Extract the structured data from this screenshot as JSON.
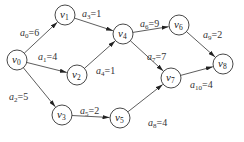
{
  "diagram": {
    "type": "AOE activity network (directed weighted graph)",
    "nodes": [
      {
        "id": "v0",
        "letter": "v",
        "sub": "0",
        "x": 17,
        "y": 60
      },
      {
        "id": "v1",
        "letter": "v",
        "sub": "1",
        "x": 65,
        "y": 15
      },
      {
        "id": "v2",
        "letter": "v",
        "sub": "2",
        "x": 77,
        "y": 75
      },
      {
        "id": "v3",
        "letter": "v",
        "sub": "3",
        "x": 62,
        "y": 115
      },
      {
        "id": "v4",
        "letter": "v",
        "sub": "4",
        "x": 123,
        "y": 34
      },
      {
        "id": "v5",
        "letter": "v",
        "sub": "5",
        "x": 120,
        "y": 118
      },
      {
        "id": "v6",
        "letter": "v",
        "sub": "6",
        "x": 179,
        "y": 25
      },
      {
        "id": "v7",
        "letter": "v",
        "sub": "7",
        "x": 171,
        "y": 78
      },
      {
        "id": "v8",
        "letter": "v",
        "sub": "8",
        "x": 223,
        "y": 64
      }
    ],
    "edges": [
      {
        "id": "a0",
        "from": "v0",
        "to": "v1",
        "letter": "a",
        "sub": "0",
        "weight": "=6",
        "lx": 20,
        "ly": 36
      },
      {
        "id": "a1",
        "from": "v0",
        "to": "v2",
        "letter": "a",
        "sub": "1",
        "weight": "=4",
        "lx": 38,
        "ly": 60
      },
      {
        "id": "a2",
        "from": "v0",
        "to": "v3",
        "letter": "a",
        "sub": "2",
        "weight": "=5",
        "lx": 9,
        "ly": 100
      },
      {
        "id": "a3",
        "from": "v1",
        "to": "v4",
        "letter": "a",
        "sub": "3",
        "weight": "=1",
        "lx": 82,
        "ly": 17
      },
      {
        "id": "a4",
        "from": "v2",
        "to": "v4",
        "letter": "a",
        "sub": "4",
        "weight": "=1",
        "lx": 96,
        "ly": 74
      },
      {
        "id": "a5",
        "from": "v3",
        "to": "v5",
        "letter": "a",
        "sub": "5",
        "weight": "=2",
        "lx": 80,
        "ly": 114
      },
      {
        "id": "a6",
        "from": "v4",
        "to": "v6",
        "letter": "a",
        "sub": "6",
        "weight": "=9",
        "lx": 140,
        "ly": 27
      },
      {
        "id": "a7",
        "from": "v4",
        "to": "v7",
        "letter": "a",
        "sub": "7",
        "weight": "=7",
        "lx": 147,
        "ly": 60
      },
      {
        "id": "a8",
        "from": "v5",
        "to": "v7",
        "letter": "a",
        "sub": "8",
        "weight": "=4",
        "lx": 148,
        "ly": 126
      },
      {
        "id": "a9",
        "from": "v6",
        "to": "v8",
        "letter": "a",
        "sub": "9",
        "weight": "=2",
        "lx": 203,
        "ly": 38
      },
      {
        "id": "a10",
        "from": "v7",
        "to": "v8",
        "letter": "a",
        "sub": "10",
        "weight": "=4",
        "lx": 190,
        "ly": 88
      }
    ],
    "node_radius": 10,
    "stroke_color": "#333333"
  }
}
